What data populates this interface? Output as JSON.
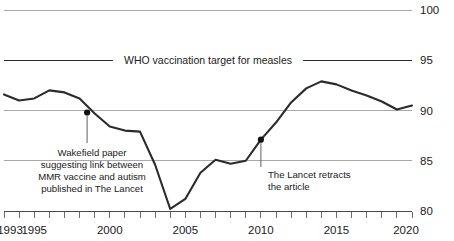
{
  "chart_data": {
    "type": "line",
    "title": "",
    "subtitle": "",
    "xlabel": "",
    "ylabel": "",
    "xlim": [
      1993,
      2020
    ],
    "ylim": [
      79.0,
      100.0
    ],
    "grid": true,
    "legend_position": "none",
    "y_ticks": [
      80,
      85,
      90,
      95,
      100
    ],
    "y_tick_labels": [
      "80",
      "85",
      "90",
      "95",
      "100"
    ],
    "x_ticks": [
      1993,
      1994,
      1995,
      1996,
      1997,
      1998,
      1999,
      2000,
      2001,
      2002,
      2003,
      2004,
      2005,
      2006,
      2007,
      2008,
      2009,
      2010,
      2011,
      2012,
      2013,
      2014,
      2015,
      2016,
      2017,
      2018,
      2019,
      2020
    ],
    "x_tick_labels": [
      "1993",
      "1995",
      "2000",
      "2005",
      "2010",
      "2015",
      "2020"
    ],
    "x_labelled_ticks": [
      1993,
      1995,
      2000,
      2005,
      2010,
      2015,
      2020
    ],
    "series": [
      {
        "name": "MMR vaccination coverage",
        "color": "#2b2b2b",
        "x": [
          1993,
          1994,
          1995,
          1996,
          1997,
          1998,
          1999,
          2000,
          2001,
          2002,
          2003,
          2004,
          2005,
          2006,
          2007,
          2008,
          2009,
          2010,
          2011,
          2012,
          2013,
          2014,
          2015,
          2016,
          2017,
          2018,
          2019,
          2020
        ],
        "values": [
          91.6,
          91.0,
          91.2,
          92.0,
          91.8,
          91.2,
          89.7,
          88.4,
          88.0,
          87.9,
          84.6,
          80.2,
          81.2,
          83.8,
          85.1,
          84.7,
          85.0,
          87.1,
          88.8,
          90.8,
          92.2,
          92.9,
          92.6,
          92.0,
          91.5,
          90.9,
          90.1,
          90.5
        ]
      }
    ],
    "reference_lines": [
      {
        "name": "who-target",
        "value": 95,
        "label": "WHO vaccination target for measles",
        "color": "#2b2b2b"
      }
    ],
    "annotations": [
      {
        "name": "wakefield-paper",
        "x": 1998.5,
        "y": 89.8,
        "lines": [
          "Wakefield paper",
          "suggesting link between",
          "MMR vaccine and autism",
          "published in The Lancet"
        ],
        "align": "center"
      },
      {
        "name": "lancet-retraction",
        "x": 2010.0,
        "y": 87.1,
        "lines": [
          "The Lancet retracts",
          "the article"
        ],
        "align": "left"
      }
    ],
    "colors": {
      "line": "#2b2b2b",
      "grid": "#a9a9a9",
      "axis": "#4a4a4a",
      "text": "#1a1a1a",
      "marker": "#111111",
      "leader": "#6f6f6f",
      "background": "#ffffff"
    }
  }
}
